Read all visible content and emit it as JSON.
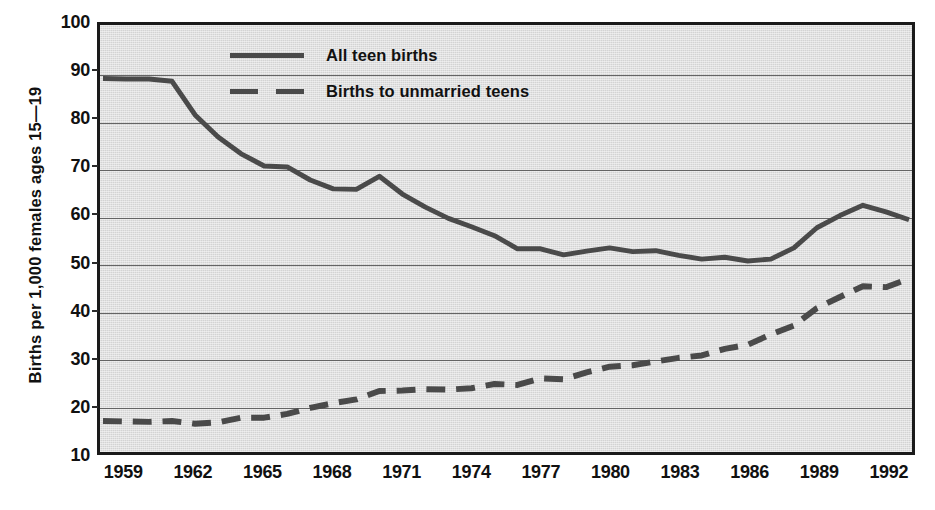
{
  "chart_data": {
    "type": "line",
    "title": "",
    "xlabel": "",
    "ylabel": "Births per 1,000 females ages 15—19",
    "xlim": [
      1958,
      1993
    ],
    "ylim": [
      10,
      100
    ],
    "ytick_values": [
      100,
      90,
      80,
      70,
      60,
      50,
      40,
      30,
      20,
      10
    ],
    "ytick_labels": [
      "100",
      "90",
      "80",
      "70",
      "60",
      "50",
      "40",
      "30",
      "20",
      "10"
    ],
    "xtick_values": [
      1959,
      1962,
      1965,
      1968,
      1971,
      1974,
      1977,
      1980,
      1983,
      1986,
      1989,
      1992
    ],
    "xtick_labels": [
      "1959",
      "1962",
      "1965",
      "1968",
      "1971",
      "1974",
      "1977",
      "1980",
      "1983",
      "1986",
      "1989",
      "1992"
    ],
    "grid": true,
    "legend_position": "upper-center",
    "x": [
      1958,
      1959,
      1960,
      1961,
      1962,
      1963,
      1964,
      1965,
      1966,
      1967,
      1968,
      1969,
      1970,
      1971,
      1972,
      1973,
      1974,
      1975,
      1976,
      1977,
      1978,
      1979,
      1980,
      1981,
      1982,
      1983,
      1984,
      1985,
      1986,
      1987,
      1988,
      1989,
      1990,
      1991,
      1992,
      1993
    ],
    "series": [
      {
        "name": "All teen births",
        "style": "solid",
        "color": "#4a4a4a",
        "values": [
          89.2,
          89.1,
          89.1,
          88.6,
          81.4,
          76.7,
          73.1,
          70.5,
          70.3,
          67.5,
          65.6,
          65.5,
          68.3,
          64.5,
          61.7,
          59.3,
          57.5,
          55.6,
          52.8,
          52.8,
          51.5,
          52.3,
          53.0,
          52.2,
          52.4,
          51.4,
          50.6,
          51.0,
          50.2,
          50.6,
          53.0,
          57.3,
          59.9,
          62.1,
          60.7,
          59.0
        ]
      },
      {
        "name": "Births to unmarried teens",
        "style": "dashed",
        "color": "#4a4a4a",
        "values": [
          16.0,
          15.9,
          15.8,
          16.0,
          15.4,
          15.7,
          16.7,
          16.7,
          17.5,
          18.8,
          19.8,
          20.6,
          22.4,
          22.5,
          22.8,
          22.7,
          23.0,
          23.9,
          23.7,
          25.1,
          24.9,
          26.4,
          27.6,
          27.9,
          28.7,
          29.5,
          30.0,
          31.4,
          32.3,
          34.5,
          36.4,
          40.1,
          42.5,
          44.8,
          44.6,
          46.4
        ]
      }
    ]
  }
}
